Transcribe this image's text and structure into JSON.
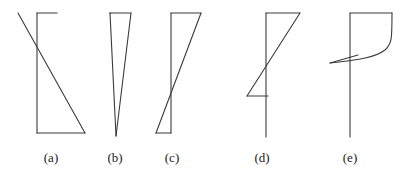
{
  "figure": {
    "type": "line-diagram-set",
    "background_color": "#ffffff",
    "stroke_color": "#3a3a3a",
    "stroke_width": 1.1,
    "canvas": {
      "width": 412,
      "height": 174
    }
  },
  "labels": [
    {
      "id": "a",
      "text": "(a)",
      "x": 51,
      "y": 150
    },
    {
      "id": "b",
      "text": "(b)",
      "x": 115,
      "y": 150
    },
    {
      "id": "c",
      "text": "(c)",
      "x": 172,
      "y": 150
    },
    {
      "id": "d",
      "text": "(d)",
      "x": 262,
      "y": 150
    },
    {
      "id": "e",
      "text": "(e)",
      "x": 350,
      "y": 150
    }
  ],
  "diagrams": [
    {
      "id": "a",
      "name": "diagram-a",
      "paths": [
        "M 37 13 L 37 133",
        "M 37 13 L 57 13",
        "M 18 13 L 85 133",
        "M 37 133 L 85 133"
      ]
    },
    {
      "id": "b",
      "name": "diagram-b",
      "paths": [
        "M 110 13 L 110 13",
        "M 110 13 L 131 13",
        "M 110 13 L 116 136",
        "M 131 13 L 116 136"
      ]
    },
    {
      "id": "c",
      "name": "diagram-c",
      "paths": [
        "M 171 13 L 171 133",
        "M 171 13 L 201 13",
        "M 156 133 L 201 13",
        "M 156 133 L 171 133"
      ]
    },
    {
      "id": "d",
      "name": "diagram-d",
      "paths": [
        "M 266 13 L 266 137",
        "M 266 13 L 300 13",
        "M 247 96 L 300 13",
        "M 247 96 L 268 96"
      ]
    },
    {
      "id": "e",
      "name": "diagram-e",
      "paths": [
        "M 350 13 L 350 137",
        "M 350 13 L 392 13",
        "M 392 13 C 392 38, 392 44, 385 50 C 376 57, 360 60, 330 63",
        "M 330 63 L 358 55"
      ]
    }
  ]
}
